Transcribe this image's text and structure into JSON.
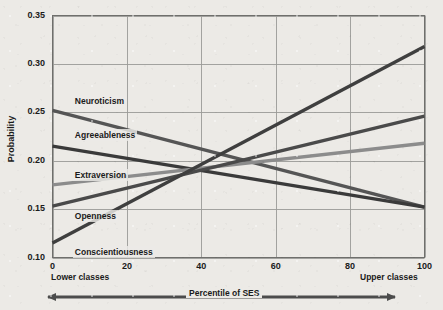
{
  "chart_data": {
    "type": "line",
    "title": "",
    "xlabel": "Percentile of SES",
    "ylabel": "Probability",
    "xlim": [
      0,
      100
    ],
    "ylim": [
      0.1,
      0.35
    ],
    "grid": true,
    "legend_position": "inline-labels",
    "xticks": [
      "0",
      "20",
      "40",
      "60",
      "80",
      "100"
    ],
    "xtick_values": [
      0,
      20,
      40,
      60,
      80,
      100
    ],
    "yticks": [
      "0.35",
      "0.30",
      "0.25",
      "0.20",
      "0.15",
      "0.10"
    ],
    "ytick_values": [
      0.35,
      0.3,
      0.25,
      0.2,
      0.15,
      0.1
    ],
    "x": [
      0,
      100
    ],
    "series": [
      {
        "name": "Neuroticism",
        "values": [
          0.252,
          0.152
        ],
        "color": "#555555",
        "label_x": 6,
        "label_y": 0.262
      },
      {
        "name": "Agreeableness",
        "values": [
          0.215,
          0.152
        ],
        "color": "#3a3a3a",
        "label_x": 6,
        "label_y": 0.227
      },
      {
        "name": "Extraversion",
        "values": [
          0.175,
          0.218
        ],
        "color": "#8c8c8c",
        "label_x": 6,
        "label_y": 0.185
      },
      {
        "name": "Openness",
        "values": [
          0.153,
          0.246
        ],
        "color": "#4a4a4a",
        "label_x": 6,
        "label_y": 0.143
      },
      {
        "name": "Conscientiousness",
        "values": [
          0.115,
          0.318
        ],
        "color": "#3f3f3f",
        "label_x": 6,
        "label_y": 0.106
      }
    ],
    "annotations": {
      "left_corner": "Lower classes",
      "right_corner": "Upper classes",
      "axis_arrow": "double-headed"
    }
  },
  "colors": {
    "background": "#eceae6",
    "grid": "#9a9a96",
    "frame": "#6f6f6c",
    "text": "#1b1b1b",
    "arrow": "#4c4c4c"
  }
}
